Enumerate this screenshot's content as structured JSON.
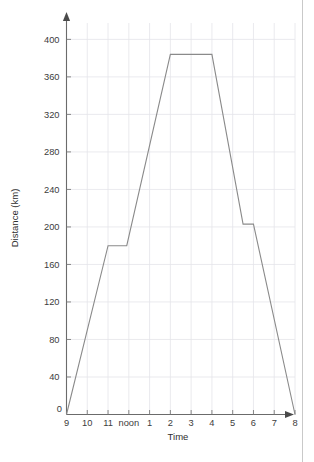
{
  "chart_data": {
    "type": "line",
    "title": "",
    "subtitle": "",
    "xlabel": "Time",
    "ylabel": "Distance (km)",
    "x_tick_labels": [
      "9",
      "10",
      "11",
      "noon",
      "1",
      "2",
      "3",
      "4",
      "5",
      "6",
      "7",
      "8"
    ],
    "x_tick_values": [
      9,
      10,
      11,
      12,
      13,
      14,
      15,
      16,
      17,
      18,
      19,
      20
    ],
    "xlim": [
      9,
      20
    ],
    "y_tick_labels": [
      "0",
      "40",
      "80",
      "120",
      "160",
      "200",
      "240",
      "280",
      "320",
      "360",
      "400"
    ],
    "y_tick_values": [
      0,
      40,
      80,
      120,
      160,
      200,
      240,
      280,
      320,
      360,
      400
    ],
    "ylim": [
      0,
      410
    ],
    "grid": true,
    "legend": false,
    "zero_origin_label": "0",
    "series": [
      {
        "name": "Journey",
        "x": [
          9,
          11,
          11.9,
          14,
          16,
          17.5,
          18,
          20
        ],
        "y": [
          0,
          180,
          180,
          384,
          384,
          203,
          203,
          0
        ],
        "x_labels": [
          "9",
          "11",
          "noon",
          "2",
          "4",
          "5:30",
          "6",
          "8"
        ]
      }
    ],
    "annotations": []
  },
  "figure": {
    "background_color": "#ffffff",
    "line_color": "#8a8a8a",
    "grid_color": "#e4e4ea",
    "axis_color": "#6b6b6b",
    "text_color": "#3c3c3c"
  }
}
